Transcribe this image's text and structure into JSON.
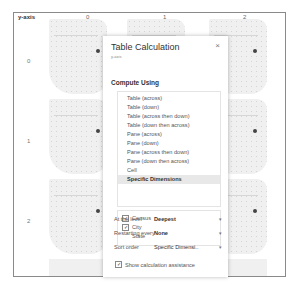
{
  "view": {
    "axis_title": "y-axis",
    "columns": [
      "0",
      "1",
      "2"
    ],
    "rows": [
      "0",
      "1",
      "2"
    ]
  },
  "dialog": {
    "title": "Table Calculation",
    "subtitle": "y-axis",
    "close_icon": "×",
    "compute_using_label": "Compute Using",
    "compute_options": [
      {
        "label": "Table (across)",
        "selected": false
      },
      {
        "label": "Table (down)",
        "selected": false
      },
      {
        "label": "Table (across then down)",
        "selected": false
      },
      {
        "label": "Table (down then across)",
        "selected": false
      },
      {
        "label": "Pane (across)",
        "selected": false
      },
      {
        "label": "Pane (down)",
        "selected": false
      },
      {
        "label": "Pane (across then down)",
        "selected": false
      },
      {
        "label": "Pane (down then across)",
        "selected": false
      },
      {
        "label": "Cell",
        "selected": false
      },
      {
        "label": "Specific Dimensions",
        "selected": true
      }
    ],
    "dimensions": [
      {
        "label": "Census",
        "checked": true,
        "check_glyph": "✓"
      },
      {
        "label": "City",
        "checked": true,
        "check_glyph": "✓"
      },
      {
        "label": "State",
        "checked": false,
        "check_glyph": ""
      }
    ],
    "at_level": {
      "label": "At the level",
      "value": "Deepest"
    },
    "restarting": {
      "label": "Restarting every",
      "value": "None"
    },
    "sort_order": {
      "label": "Sort order",
      "value": "Specific Dimensi.."
    },
    "caret": "▾",
    "show_assistance": {
      "label": "Show calculation assistance",
      "checked": true,
      "check_glyph": "✓"
    }
  }
}
